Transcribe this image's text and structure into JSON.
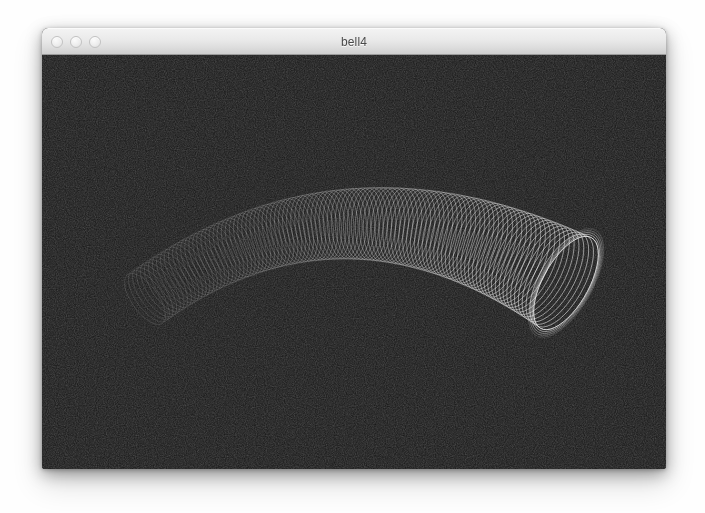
{
  "window": {
    "title": "bell4",
    "traffic_lights": [
      {
        "name": "close-button",
        "label": ""
      },
      {
        "name": "minimize-button",
        "label": ""
      },
      {
        "name": "zoom-button",
        "label": ""
      }
    ],
    "bounds": {
      "x": 42,
      "y": 28,
      "width": 624,
      "height": 441
    },
    "titlebar_height": 27,
    "colors": {
      "titlebar_top": "#f3f3f3",
      "titlebar_bottom": "#cfcfcf",
      "titlebar_border": "#9b9b9b",
      "title_text": "#4a4a4a",
      "canvas_background": "#161616",
      "wireframe_stroke": "#ffffff"
    }
  },
  "canvas": {
    "name": "3d-wireframe-viewport",
    "background": "#161616",
    "noise": true,
    "description": "3D wireframe bell / horn surface"
  },
  "chart_data": {
    "type": "line",
    "title": "bell4",
    "xlabel": "",
    "ylabel": "",
    "render_style": "wireframe-rings",
    "geometry": "flared curved tube (bell horn)",
    "ring_count": 104,
    "ring_segments": 46,
    "viewport": {
      "width": 624,
      "height": 414
    },
    "path_start": {
      "x": 103,
      "y": 244
    },
    "path_apex": {
      "x": 300,
      "y": 102
    },
    "path_end": {
      "x": 524,
      "y": 228
    },
    "radius_start": 30,
    "radius_end": 52,
    "perspective_squash": 0.44,
    "brightness_start": 0.22,
    "brightness_end": 1.0,
    "stroke_color": "#ffffff",
    "stroke_width": 0.55
  }
}
